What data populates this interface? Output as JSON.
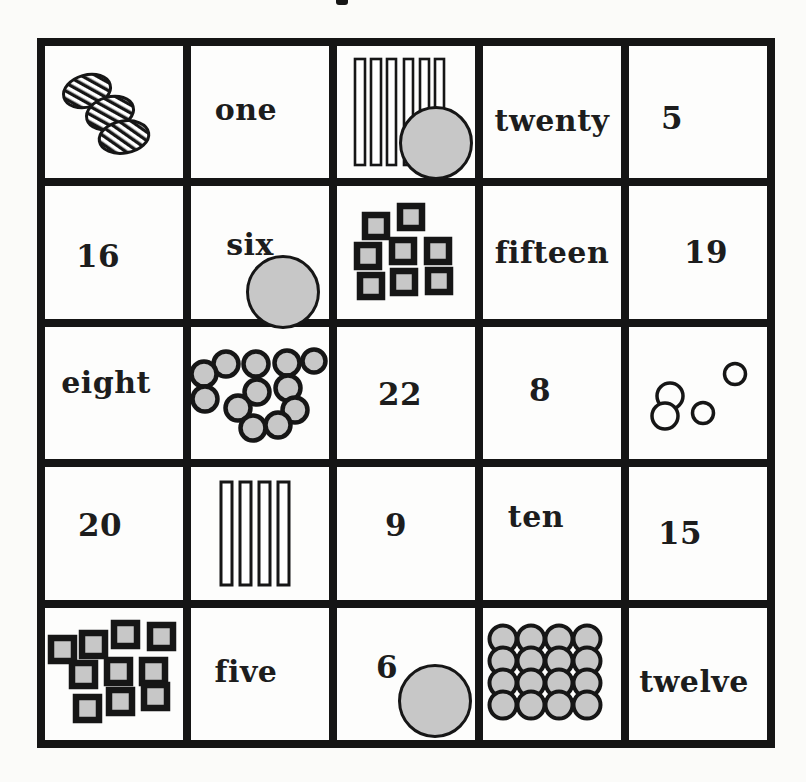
{
  "page": {
    "kind": "scanned number-bingo worksheet",
    "top_mark": "cropped descender of title text above grid"
  },
  "colors": {
    "grid_line": "#151515",
    "shape_gray": "#c7c7c7",
    "text": "#1d1d1d",
    "paper": "#fbfbf9",
    "shape_outline": "#161616"
  },
  "chips": {
    "description": "gray bingo marker chips placed on cells",
    "positions": [
      "r1c3",
      "r2c2",
      "r5c3"
    ],
    "count": 3
  },
  "grid": {
    "rows": [
      {
        "cells": [
          {
            "kind": "picture",
            "picture": "hatched-ovals",
            "count": 3
          },
          {
            "kind": "word",
            "label": "one"
          },
          {
            "kind": "picture",
            "picture": "vertical-bars",
            "count": 6,
            "chip": true
          },
          {
            "kind": "word",
            "label": "twenty"
          },
          {
            "kind": "number",
            "label": "5"
          }
        ]
      },
      {
        "cells": [
          {
            "kind": "number",
            "label": "16"
          },
          {
            "kind": "word",
            "label": "six",
            "chip": true
          },
          {
            "kind": "picture",
            "picture": "squares-cluster",
            "count": 8
          },
          {
            "kind": "word",
            "label": "fifteen"
          },
          {
            "kind": "number",
            "label": "19"
          }
        ]
      },
      {
        "cells": [
          {
            "kind": "word",
            "label": "eight"
          },
          {
            "kind": "picture",
            "picture": "circles-cluster",
            "count": 12
          },
          {
            "kind": "number",
            "label": "22"
          },
          {
            "kind": "number",
            "label": "8"
          },
          {
            "kind": "picture",
            "picture": "outline-circles",
            "count": 4
          }
        ]
      },
      {
        "cells": [
          {
            "kind": "number",
            "label": "20"
          },
          {
            "kind": "picture",
            "picture": "vertical-bars",
            "count": 4
          },
          {
            "kind": "number",
            "label": "9"
          },
          {
            "kind": "word",
            "label": "ten"
          },
          {
            "kind": "number",
            "label": "15"
          }
        ]
      },
      {
        "cells": [
          {
            "kind": "picture",
            "picture": "squares-cluster",
            "count": 10
          },
          {
            "kind": "word",
            "label": "five"
          },
          {
            "kind": "number",
            "label": "6",
            "chip": true
          },
          {
            "kind": "picture",
            "picture": "circle-grid",
            "count": 16
          },
          {
            "kind": "word",
            "label": "twelve"
          }
        ]
      }
    ]
  }
}
